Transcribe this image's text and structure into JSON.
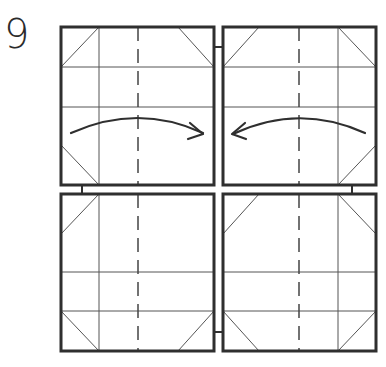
{
  "step": {
    "number": "9"
  },
  "colors": {
    "outline": "#2f2f2f",
    "crease": "#555555",
    "background": "#ffffff"
  },
  "diagram": {
    "panels": [
      {
        "id": "top-left",
        "x": 61,
        "y": 27,
        "w": 153,
        "h": 158
      },
      {
        "id": "top-right",
        "x": 223,
        "y": 27,
        "w": 153,
        "h": 158
      },
      {
        "id": "bottom-left",
        "x": 61,
        "y": 194,
        "w": 153,
        "h": 157
      },
      {
        "id": "bottom-right",
        "x": 223,
        "y": 194,
        "w": 153,
        "h": 157
      }
    ],
    "arrows": [
      {
        "id": "fold-arrow-right",
        "direction": "right"
      },
      {
        "id": "fold-arrow-left",
        "direction": "left"
      }
    ]
  }
}
